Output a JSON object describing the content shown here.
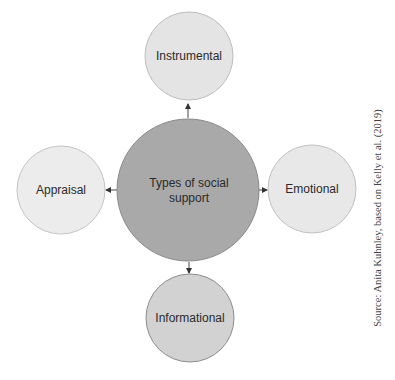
{
  "diagram": {
    "center": {
      "label_line1": "Types of social",
      "label_line2": "support",
      "fill": "#a9a9a9",
      "stroke": "#8a8a8a"
    },
    "nodes": [
      {
        "id": "instrumental",
        "label": "Instrumental",
        "fill": "#e4e4e4",
        "stroke": "#bdbdbd"
      },
      {
        "id": "appraisal",
        "label": "Appraisal",
        "fill": "#ececec",
        "stroke": "#c4c4c4"
      },
      {
        "id": "emotional",
        "label": "Emotional",
        "fill": "#e8e8e8",
        "stroke": "#c0c0c0"
      },
      {
        "id": "informational",
        "label": "Informational",
        "fill": "#d2d2d2",
        "stroke": "#8c8c8c"
      }
    ],
    "edges": [
      {
        "from": "center",
        "to": "instrumental"
      },
      {
        "from": "center",
        "to": "appraisal"
      },
      {
        "from": "center",
        "to": "emotional"
      },
      {
        "from": "center",
        "to": "informational"
      }
    ],
    "source": "Source: Anita Kuhnley, based on Kelly et al. (2019)"
  }
}
